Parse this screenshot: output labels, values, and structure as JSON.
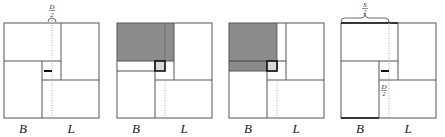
{
  "figure": {
    "panels": [
      {
        "id": "panel-1",
        "x": 4,
        "shaded": false,
        "top_label": {
          "num": "D",
          "den": "2"
        },
        "bottom_labels": {
          "left": "B",
          "right": "L"
        }
      },
      {
        "id": "panel-2",
        "x": 117,
        "shaded": "top-full",
        "bottom_labels": {
          "left": "B",
          "right": "L"
        }
      },
      {
        "id": "panel-3",
        "x": 229,
        "shaded": "top-left",
        "bottom_labels": {
          "left": "B",
          "right": "L"
        }
      },
      {
        "id": "panel-4",
        "x": 341,
        "shaded": false,
        "top_label": {
          "num": "S",
          "den": "2"
        },
        "side_label": {
          "num": "D",
          "den": "2"
        },
        "bottom_labels": {
          "left": "B",
          "right": "L"
        }
      }
    ],
    "colors": {
      "line": "#555555",
      "shade": "#8c8c8c",
      "dotted": "#aaaaaa",
      "bold": "#111111"
    }
  }
}
